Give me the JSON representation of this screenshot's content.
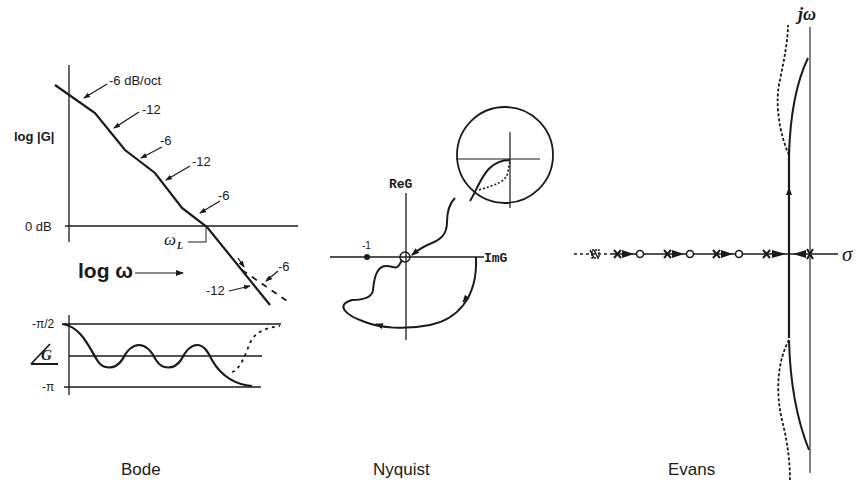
{
  "figure": {
    "panels": [
      {
        "id": "bode",
        "caption": "Bode",
        "magnitude": {
          "y_label": "log |G|",
          "zero_label": "0 dB",
          "crossover_label": "ω",
          "crossover_subscript": "L",
          "x_label": "log ω",
          "slope_annotations": [
            "-6 dB/oct",
            "-12",
            "-6",
            "-12",
            "-6",
            "-6",
            "-12"
          ]
        },
        "phase": {
          "y_label": "∠G",
          "top_label": "-π/2",
          "bottom_label": "-π"
        }
      },
      {
        "id": "nyquist",
        "caption": "Nyquist",
        "axis_vertical": "ReG",
        "axis_horizontal": "ImG",
        "critical_point": "-1"
      },
      {
        "id": "evans",
        "caption": "Evans",
        "axis_vertical": "jω",
        "axis_horizontal": "σ"
      }
    ],
    "colors": {
      "ink": "#1a1a1a",
      "background": "#ffffff"
    }
  }
}
